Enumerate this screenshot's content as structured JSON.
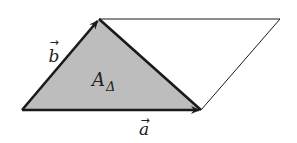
{
  "diagram": {
    "colors": {
      "triangle_fill": "#bdbdbd",
      "vector_stroke": "#1a1a1a",
      "parallelogram_stroke": "#1a1a1a",
      "background": "#ffffff",
      "text": "#222222"
    },
    "points": {
      "origin": [
        22,
        110
      ],
      "a_tip": [
        201,
        110
      ],
      "b_tip": [
        99,
        19
      ],
      "far_corner": [
        280,
        19
      ]
    },
    "vectors": [
      {
        "name": "a",
        "label": "a",
        "arrow_symbol": "→",
        "from": "origin",
        "to": "a_tip"
      },
      {
        "name": "b",
        "label": "b",
        "arrow_symbol": "→",
        "from": "origin",
        "to": "b_tip"
      }
    ],
    "area_label": {
      "main": "A",
      "subscript": "Δ"
    },
    "shapes": {
      "triangle": [
        "origin",
        "b_tip",
        "a_tip"
      ],
      "parallelogram": [
        "origin",
        "a_tip",
        "far_corner",
        "b_tip"
      ]
    }
  }
}
